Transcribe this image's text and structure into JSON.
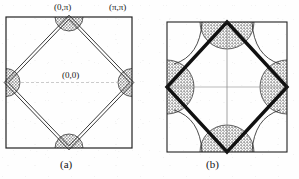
{
  "figure": {
    "type": "scientific-figure",
    "background_color": "#ffffff",
    "ink_color": "#1a1a1a",
    "shade_color": "#9a9a9a",
    "panels": [
      {
        "id": "a",
        "caption": "(a)",
        "square": {
          "x": 6,
          "y": 17,
          "w": 126,
          "h": 131
        },
        "diamond_style": "double-thin-line",
        "diamond_line_width": 0.9,
        "pocket_radius": 14,
        "pockets": [
          {
            "name": "top",
            "cx": 69,
            "cy": 17
          },
          {
            "name": "bottom",
            "cx": 69,
            "cy": 148
          },
          {
            "name": "left",
            "cx": 6,
            "cy": 82.5
          },
          {
            "name": "right",
            "cx": 132,
            "cy": 82.5
          }
        ],
        "labels": [
          {
            "name": "label-0-pi",
            "text": "(0,π)",
            "x": 55,
            "y": 3
          },
          {
            "name": "label-pi-pi",
            "text": "(π,π)",
            "x": 110,
            "y": 3
          },
          {
            "name": "label-0-0",
            "text": "(0,0)",
            "x": 63,
            "y": 72
          }
        ],
        "axes": {
          "horizontal": true,
          "vertical": false,
          "style": "dashed-faint"
        }
      },
      {
        "id": "b",
        "caption": "(b)",
        "square": {
          "x": 167,
          "y": 22,
          "w": 120,
          "h": 130
        },
        "diamond_style": "thick-solid-line",
        "diamond_line_width": 3.4,
        "pocket_radius": 27,
        "pockets": [
          {
            "name": "top",
            "cx": 227,
            "cy": 22
          },
          {
            "name": "bottom",
            "cx": 227,
            "cy": 152
          },
          {
            "name": "left",
            "cx": 167,
            "cy": 87
          },
          {
            "name": "right",
            "cx": 287,
            "cy": 87
          }
        ],
        "labels": [],
        "axes": {
          "horizontal": true,
          "vertical": true,
          "style": "faint-solid"
        }
      }
    ]
  },
  "captions": {
    "panel_a": "(a)",
    "panel_b": "(b)"
  },
  "labels": {
    "zero_pi": "(0,π)",
    "pi_pi": "(π,π)",
    "zero_zero": "(0,0)"
  }
}
